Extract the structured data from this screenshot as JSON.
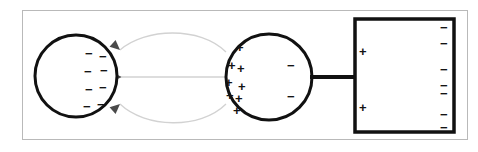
{
  "diagram": {
    "background_color": "#ffffff",
    "frame_color": "#b9b9b9",
    "stroke_color": "#111111",
    "field_line_color": "#d2d2d2",
    "arrowhead_color": "#4a4a4a",
    "glyphs": {
      "plus": "+",
      "minus": "−"
    },
    "objects": {
      "left_sphere": {
        "name": "negatively-charged-sphere",
        "cx": 76,
        "cy": 76,
        "r": 41,
        "charge_sign": "minus",
        "charge_count": 8,
        "charges": [
          {
            "x": 89,
            "y": 53,
            "sign": "−"
          },
          {
            "x": 103,
            "y": 56,
            "sign": "−"
          },
          {
            "x": 88,
            "y": 71,
            "sign": "−"
          },
          {
            "x": 104,
            "y": 70,
            "sign": "−"
          },
          {
            "x": 89,
            "y": 89,
            "sign": "−"
          },
          {
            "x": 103,
            "y": 87,
            "sign": "−"
          },
          {
            "x": 87,
            "y": 106,
            "sign": "−"
          },
          {
            "x": 101,
            "y": 104,
            "sign": "−"
          }
        ]
      },
      "middle_sphere": {
        "name": "polarized-conducting-sphere",
        "cx": 269,
        "cy": 77,
        "r": 43,
        "positive_count": 8,
        "negative_count": 2,
        "charges": [
          {
            "x": 239,
            "y": 47,
            "sign": "+"
          },
          {
            "x": 231,
            "y": 65,
            "sign": "+"
          },
          {
            "x": 240,
            "y": 68,
            "sign": "+"
          },
          {
            "x": 228,
            "y": 82,
            "sign": "+"
          },
          {
            "x": 241,
            "y": 86,
            "sign": "+"
          },
          {
            "x": 229,
            "y": 95,
            "sign": "+"
          },
          {
            "x": 238,
            "y": 98,
            "sign": "+"
          },
          {
            "x": 236,
            "y": 110,
            "sign": "+"
          },
          {
            "x": 290,
            "y": 65,
            "sign": "−"
          },
          {
            "x": 290,
            "y": 96,
            "sign": "−"
          }
        ]
      },
      "right_plate": {
        "name": "grounded-conducting-plate",
        "x": 355,
        "y": 19,
        "width": 99,
        "height": 113,
        "positive_count": 2,
        "negative_count": 7,
        "charges": [
          {
            "x": 361,
            "y": 51,
            "sign": "+"
          },
          {
            "x": 361,
            "y": 107,
            "sign": "+"
          },
          {
            "x": 443,
            "y": 27,
            "sign": "−"
          },
          {
            "x": 443,
            "y": 43,
            "sign": "−"
          },
          {
            "x": 443,
            "y": 69,
            "sign": "−"
          },
          {
            "x": 443,
            "y": 85,
            "sign": "−"
          },
          {
            "x": 443,
            "y": 93,
            "sign": "−"
          },
          {
            "x": 443,
            "y": 114,
            "sign": "−"
          },
          {
            "x": 443,
            "y": 127,
            "sign": "−"
          }
        ]
      },
      "connector_wire": {
        "name": "connecting-wire",
        "x1": 312,
        "y1": 77,
        "x2": 356,
        "y2": 77
      },
      "field_lines": [
        {
          "name": "field-line-upper",
          "path": "M 226 52 C 200 26, 145 28, 120 50"
        },
        {
          "name": "field-line-middle",
          "path": "M 226 77 L 122 77"
        },
        {
          "name": "field-line-lower",
          "path": "M 226 104 C 200 130, 145 128, 120 104"
        }
      ],
      "arrowheads": [
        {
          "name": "arrowhead-upper",
          "x": 120,
          "y": 50,
          "angle": 222
        },
        {
          "name": "arrowhead-middle",
          "x": 122,
          "y": 77,
          "angle": 180
        },
        {
          "name": "arrowhead-lower",
          "x": 120,
          "y": 104,
          "angle": 138
        }
      ]
    }
  }
}
